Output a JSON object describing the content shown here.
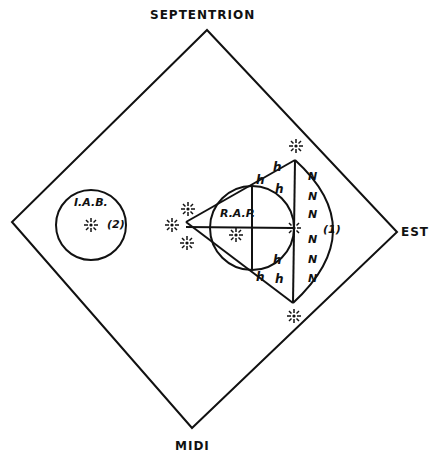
{
  "compass": {
    "north": "SEPTENTRION",
    "east": "EST",
    "south": "MIDI"
  },
  "regions": {
    "left_circle": {
      "label": "I.A.B.",
      "number": "(2)"
    },
    "inner_circle": {
      "label": "R.A.P."
    },
    "right_arc": {
      "number": "(1)"
    }
  },
  "marks": {
    "h_glyph": "h",
    "n_glyph": "N"
  },
  "colors": {
    "ink": "#111111",
    "background": "#ffffff"
  }
}
